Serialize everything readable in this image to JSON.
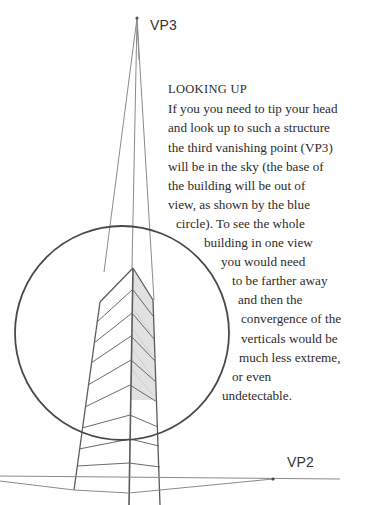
{
  "diagram": {
    "vanishing_points": [
      {
        "id": "vp3",
        "label": "VP3",
        "x": 137,
        "y": 18
      },
      {
        "id": "vp2",
        "label": "VP2",
        "x": 273,
        "y": 479
      }
    ],
    "circle": {
      "cx": 122,
      "cy": 333,
      "r": 107,
      "stroke": "#4a4848"
    },
    "line_color": "#7a7a7a",
    "building_stroke": "#555555",
    "shade_color": "#d9d9d9"
  },
  "caption": {
    "heading": "LOOKING UP",
    "lines": [
      "If you you need to tip your head",
      "and look up to such a structure",
      "the third vanishing point (VP3)",
      "will be in the sky (the base of",
      "the building will be out of",
      "view, as shown by the blue",
      "circle). To see the whole",
      "building in one view",
      "you would need",
      "to be farther away",
      "and then the",
      "convergence of the",
      "verticals would be",
      "much less extreme,",
      "or even",
      "undetectable."
    ]
  }
}
